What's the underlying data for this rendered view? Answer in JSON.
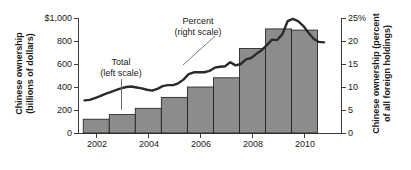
{
  "chart_data": {
    "type": "bar",
    "title": "",
    "subtitle": "",
    "xlabel": "",
    "ylabel": "Chinese ownership (billions of dollars)",
    "y2label": "Chinese ownership (percent of all foreign holdings)",
    "grid": false,
    "legend_position": "inline-annotations",
    "x_ticks": [
      "2002",
      "2004",
      "2006",
      "2008",
      "2010"
    ],
    "x_tick_values": [
      2002,
      2004,
      2006,
      2008,
      2010
    ],
    "xlim": [
      2001.3,
      2011.4
    ],
    "ylim": [
      0,
      1000
    ],
    "y_ticks": [
      "0",
      "200",
      "400",
      "600",
      "800",
      "$1,000"
    ],
    "y_tick_values": [
      0,
      200,
      400,
      600,
      800,
      1000
    ],
    "y2lim": [
      0,
      25
    ],
    "y2_ticks": [
      "0",
      "5",
      "10",
      "15",
      "20",
      "25%"
    ],
    "y2_tick_values": [
      0,
      5,
      10,
      15,
      20,
      25
    ],
    "series": [
      {
        "name": "Total (left scale)",
        "type": "bar",
        "axis": "left",
        "units": "billions of dollars",
        "color": "#8c8c8c",
        "edge_color": "#1a1a1a",
        "categories": [
          2002,
          2003,
          2004,
          2005,
          2006,
          2007,
          2008,
          2009,
          2010
        ],
        "values": [
          120,
          160,
          215,
          310,
          400,
          480,
          735,
          905,
          895
        ]
      },
      {
        "name": "Percent (right scale)",
        "type": "line",
        "axis": "right",
        "units": "percent of all foreign holdings",
        "color": "#2b2b2b",
        "x": [
          2001.55,
          2001.75,
          2001.95,
          2002.15,
          2002.35,
          2002.55,
          2002.75,
          2002.95,
          2003.15,
          2003.35,
          2003.55,
          2003.75,
          2003.95,
          2004.15,
          2004.35,
          2004.55,
          2004.75,
          2004.95,
          2005.15,
          2005.35,
          2005.55,
          2005.75,
          2005.95,
          2006.15,
          2006.35,
          2006.55,
          2006.75,
          2006.95,
          2007.15,
          2007.35,
          2007.55,
          2007.75,
          2007.95,
          2008.15,
          2008.35,
          2008.55,
          2008.75,
          2008.95,
          2009.15,
          2009.35,
          2009.55,
          2009.75,
          2009.95,
          2010.15,
          2010.35,
          2010.55,
          2010.75
        ],
        "values": [
          7.1,
          7.2,
          7.6,
          8.0,
          8.5,
          8.9,
          9.3,
          9.7,
          10.0,
          10.1,
          9.9,
          9.7,
          9.4,
          9.2,
          9.6,
          10.2,
          10.4,
          10.4,
          10.8,
          11.6,
          12.8,
          13.2,
          13.2,
          13.2,
          13.5,
          14.2,
          14.4,
          14.5,
          15.4,
          14.7,
          15.0,
          16.0,
          16.3,
          17.2,
          18.0,
          19.1,
          20.3,
          20.2,
          21.5,
          24.3,
          24.8,
          24.3,
          23.3,
          21.8,
          20.5,
          19.8,
          19.7
        ]
      }
    ],
    "annotations": [
      {
        "text_line1": "Total",
        "text_line2": "(left scale)",
        "points_to": "bar-2003"
      },
      {
        "text_line1": "Percent",
        "text_line2": "(right scale)",
        "points_to": "percent-line"
      }
    ]
  },
  "axes": {
    "left": {
      "title_line1": "Chinese ownership",
      "title_line2": "(billions of dollars)",
      "tick_labels": [
        "$1,000",
        "800",
        "600",
        "400",
        "200",
        "0"
      ]
    },
    "right": {
      "title_line1": "Chinese ownership (percent",
      "title_line2": "of all foreign holdings)",
      "tick_labels": [
        "25%",
        "20",
        "15",
        "10",
        "5",
        "0"
      ]
    },
    "bottom": {
      "tick_labels": [
        "2002",
        "2004",
        "2006",
        "2008",
        "2010"
      ]
    }
  },
  "annotations": {
    "total": {
      "line1": "Total",
      "line2": "(left scale)"
    },
    "percent": {
      "line1": "Percent",
      "line2": "(right scale)"
    }
  },
  "colors": {
    "bar_fill": "#8c8c8c",
    "bar_edge": "#1a1a1a",
    "line": "#2b2b2b",
    "axis": "#3c3c3c",
    "text": "#1a1a1a",
    "background": "#ffffff"
  }
}
